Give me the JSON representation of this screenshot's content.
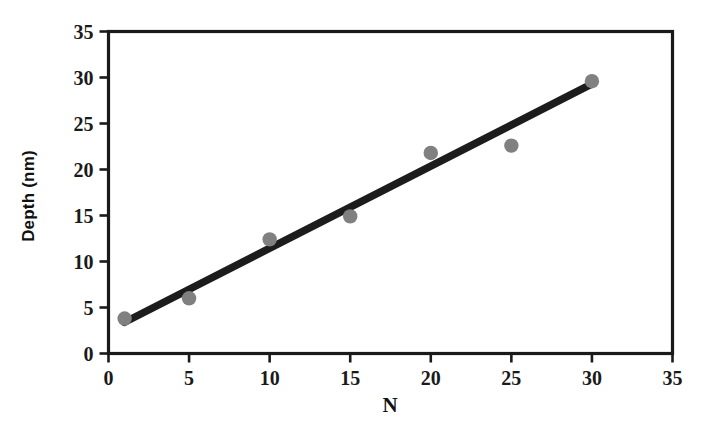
{
  "chart_data": {
    "type": "scatter",
    "title": "",
    "subtitle": "",
    "xlabel": "N",
    "ylabel": "Depth (nm)",
    "xlim": [
      0,
      35
    ],
    "ylim": [
      0,
      35
    ],
    "xticks": [
      0,
      5,
      10,
      15,
      20,
      25,
      30,
      35
    ],
    "yticks": [
      0,
      5,
      10,
      15,
      20,
      25,
      30,
      35
    ],
    "xtick_labels": [
      "0",
      "5",
      "10",
      "15",
      "20",
      "25",
      "30",
      "35"
    ],
    "ytick_labels": [
      "0",
      "5",
      "10",
      "15",
      "20",
      "25",
      "30",
      "35"
    ],
    "grid": false,
    "legend": null,
    "legend_position": "none",
    "marker_color": "#808080",
    "line_color": "#1c1c1c",
    "axis_color": "#1a1a1a",
    "background_color": "#ffffff",
    "series": [
      {
        "name": "Depth measurements",
        "kind": "scatter",
        "marker": "circle",
        "color": "#808080",
        "x": [
          1,
          5,
          10,
          15,
          20,
          25,
          30
        ],
        "y": [
          3.8,
          6.0,
          12.4,
          14.9,
          21.8,
          22.6,
          29.6
        ],
        "points": [
          {
            "x": 1,
            "y": 3.8
          },
          {
            "x": 5,
            "y": 6.0
          },
          {
            "x": 10,
            "y": 12.4
          },
          {
            "x": 15,
            "y": 14.9
          },
          {
            "x": 20,
            "y": 21.8
          },
          {
            "x": 25,
            "y": 22.6
          },
          {
            "x": 30,
            "y": 29.6
          }
        ]
      },
      {
        "name": "Linear fit",
        "kind": "line",
        "color": "#1c1c1c",
        "x": [
          1,
          30
        ],
        "y": [
          3.4,
          29.3
        ]
      }
    ]
  },
  "axis_titles": {
    "x": "N",
    "y": "Depth (nm)"
  }
}
